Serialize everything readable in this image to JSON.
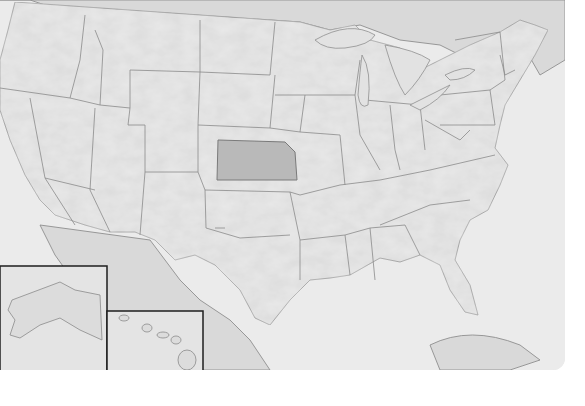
{
  "map": {
    "title": "United States locator map",
    "style": "grayscale shaded relief",
    "highlighted_state": "Kansas",
    "colors": {
      "ocean": "#e9e9e9",
      "land": "#d9d9d9",
      "highlight": "#b9b9b9",
      "border": "#8a8a8a",
      "inset_frame": "#1e1e1e",
      "background": "#ffffff"
    },
    "insets": [
      {
        "name": "Alaska"
      },
      {
        "name": "Hawaii"
      }
    ],
    "labels": []
  }
}
